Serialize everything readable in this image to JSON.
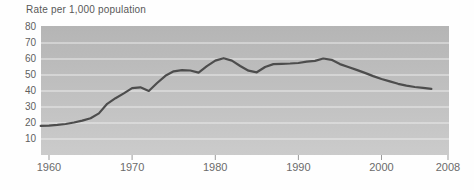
{
  "chart_data": {
    "type": "line",
    "title": "Rate per 1,000 population",
    "xlabel": "",
    "ylabel": "Rate per 1,000 population",
    "xlim": [
      1959,
      2008
    ],
    "ylim": [
      0,
      80
    ],
    "x_ticks": [
      1960,
      1970,
      1980,
      1990,
      2000,
      2008
    ],
    "y_ticks": [
      10,
      20,
      30,
      40,
      50,
      60,
      70,
      80
    ],
    "gridlines": [
      10,
      20,
      30,
      40,
      50,
      60,
      70
    ],
    "grid": "horizontal light lines over gray band",
    "legend": "none",
    "series": [
      {
        "name": "rate-per-1000-population",
        "x": [
          1959,
          1960,
          1961,
          1962,
          1963,
          1964,
          1965,
          1966,
          1967,
          1968,
          1969,
          1970,
          1971,
          1972,
          1973,
          1974,
          1975,
          1976,
          1977,
          1978,
          1979,
          1980,
          1981,
          1982,
          1983,
          1984,
          1985,
          1986,
          1987,
          1988,
          1989,
          1990,
          1991,
          1992,
          1993,
          1994,
          1995,
          1996,
          1997,
          1998,
          1999,
          2000,
          2001,
          2002,
          2003,
          2004,
          2005,
          2006
        ],
        "y": [
          18.2,
          18.4,
          18.8,
          19.4,
          20.3,
          21.5,
          23.0,
          26.0,
          32.0,
          35.5,
          38.5,
          41.8,
          42.3,
          40.0,
          45.0,
          49.5,
          52.3,
          53.0,
          52.8,
          51.5,
          55.5,
          59.0,
          60.5,
          59.0,
          55.6,
          52.7,
          51.7,
          55.0,
          56.8,
          57.0,
          57.2,
          57.5,
          58.3,
          58.8,
          60.3,
          59.5,
          56.8,
          55.0,
          53.2,
          51.3,
          49.3,
          47.5,
          46.0,
          44.5,
          43.4,
          42.5,
          42.0,
          41.3
        ]
      }
    ]
  },
  "colors": {
    "background": "#fefefe",
    "band_top": "#b5b5b5",
    "band_bottom": "#cbcbcb",
    "gridline": "#ececec",
    "line": "#4d4d4d",
    "tick": "#9b9b9b",
    "axis_label": "#5f5f5f",
    "title": "#585858"
  }
}
